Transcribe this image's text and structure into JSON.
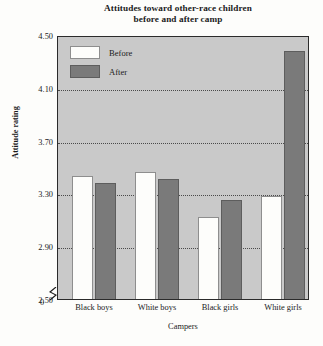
{
  "chart_data": {
    "type": "bar",
    "title": "Attitudes toward other-race children before and after camp",
    "title_lines": [
      "Attitudes toward other-race children",
      "before and after camp"
    ],
    "xlabel": "Campers",
    "ylabel": "Attitude rating",
    "categories": [
      "Black boys",
      "White boys",
      "Black girls",
      "White girls"
    ],
    "series": [
      {
        "name": "Before",
        "color": "#fdfdfb",
        "values": [
          3.43,
          3.46,
          3.12,
          3.28
        ]
      },
      {
        "name": "After",
        "color": "#7a7a7a",
        "values": [
          3.38,
          3.41,
          3.25,
          4.38
        ]
      }
    ],
    "ylim": [
      2.5,
      4.5
    ],
    "yticks": [
      "2.50",
      "2.90",
      "3.30",
      "3.70",
      "4.10",
      "4.50"
    ],
    "ytick_values": [
      2.5,
      2.9,
      3.3,
      3.7,
      4.1,
      4.5
    ],
    "axis_break_label": "0",
    "grid": true,
    "gridlines_at": [
      2.9,
      3.3,
      3.7,
      4.1
    ],
    "legend_position": "top-left inside plot",
    "plot_background": "#c9c9c9",
    "axis_color": "#2b2b2b"
  }
}
